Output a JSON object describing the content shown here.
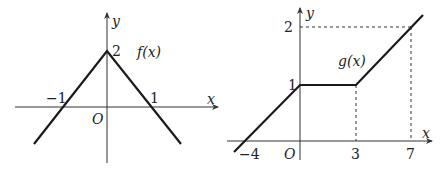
{
  "figures": [
    {
      "id": "f",
      "function_label": "f(x)",
      "axis_x_label": "x",
      "axis_y_label": "y",
      "origin_label": "O",
      "ticks": {
        "x_neg": "−1",
        "x_pos": "1",
        "y_top": "2"
      },
      "points": [
        [
          -1.7,
          -0.85
        ],
        [
          0,
          2
        ],
        [
          1.7,
          -0.85
        ]
      ]
    },
    {
      "id": "g",
      "function_label": "g(x)",
      "axis_x_label": "x",
      "axis_y_label": "y",
      "origin_label": "O",
      "ticks": {
        "x_neg": "−4",
        "x_3": "3",
        "x_7": "7",
        "y_1": "1",
        "y_2": "2"
      },
      "points": [
        [
          -4.8,
          -0.2
        ],
        [
          0,
          1
        ],
        [
          3,
          1
        ],
        [
          7.8,
          2.2
        ]
      ]
    }
  ],
  "colors": {
    "stroke": "#1a1a1a",
    "axis": "#333333",
    "text": "#222222"
  }
}
